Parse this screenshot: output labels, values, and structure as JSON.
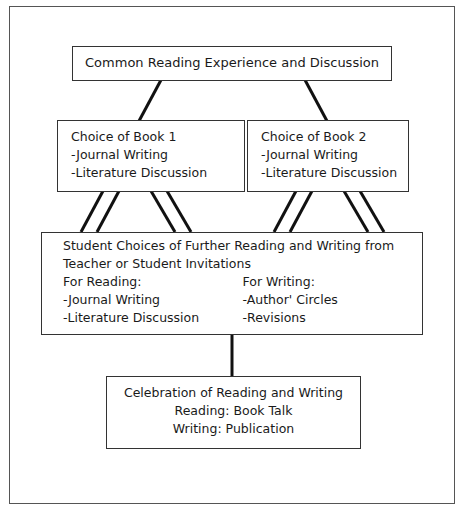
{
  "diagram": {
    "top": {
      "label": "Common Reading Experience and Discussion"
    },
    "book1": {
      "title": "Choice of Book 1",
      "items": [
        "-Journal Writing",
        "-Literature Discussion"
      ]
    },
    "book2": {
      "title": "Choice of Book 2",
      "items": [
        "-Journal Writing",
        "-Literature Discussion"
      ]
    },
    "choices": {
      "title_line1": "Student Choices of Further Reading and Writing from",
      "title_line2": "Teacher or Student Invitations",
      "reading": {
        "heading": "For Reading:",
        "items": [
          "-Journal Writing",
          "-Literature Discussion"
        ]
      },
      "writing": {
        "heading": "For Writing:",
        "items": [
          "-Author' Circles",
          "-Revisions"
        ]
      }
    },
    "celebration": {
      "title": "Celebration of Reading and Writing",
      "reading": "Reading:  Book Talk",
      "writing": "Writing:  Publication"
    },
    "colors": {
      "line": "#111111",
      "border": "#333333",
      "background": "#ffffff"
    }
  }
}
